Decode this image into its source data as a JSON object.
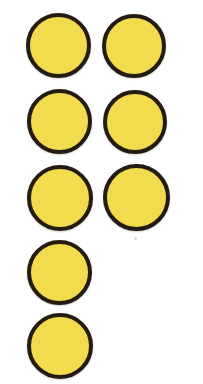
{
  "scene": {
    "title": "Yellow counter circles",
    "description": "Eight yellow filled circles with dark outlines arranged in two columns over five rows",
    "background_color": "#ffffff",
    "canvas": {
      "width": 203,
      "height": 384
    },
    "total_count": 8,
    "column_count": 2,
    "row_count": 5,
    "left_column_count": 5,
    "right_column_count": 3
  },
  "style": {
    "fill_color": "#f2dc4e",
    "outline_color": "#241b11",
    "outline_width_px": 4
  },
  "counters": [
    {
      "id": "counter-1",
      "label": "1",
      "row": 1,
      "column": "left",
      "x": 26,
      "y": 13,
      "size": 65
    },
    {
      "id": "counter-2",
      "label": "2",
      "row": 1,
      "column": "right",
      "x": 102,
      "y": 14,
      "size": 64
    },
    {
      "id": "counter-3",
      "label": "3",
      "row": 2,
      "column": "left",
      "x": 27,
      "y": 89,
      "size": 65
    },
    {
      "id": "counter-4",
      "label": "4",
      "row": 2,
      "column": "right",
      "x": 103,
      "y": 90,
      "size": 64
    },
    {
      "id": "counter-5",
      "label": "5",
      "row": 3,
      "column": "left",
      "x": 27,
      "y": 165,
      "size": 66
    },
    {
      "id": "counter-6",
      "label": "6",
      "row": 3,
      "column": "right",
      "x": 103,
      "y": 164,
      "size": 67
    },
    {
      "id": "counter-7",
      "label": "7",
      "row": 4,
      "column": "left",
      "x": 27,
      "y": 240,
      "size": 65
    },
    {
      "id": "counter-8",
      "label": "8",
      "row": 5,
      "column": "left",
      "x": 27,
      "y": 313,
      "size": 66
    }
  ],
  "artifacts": [
    {
      "id": "speck-1",
      "x": 134,
      "y": 237
    }
  ]
}
